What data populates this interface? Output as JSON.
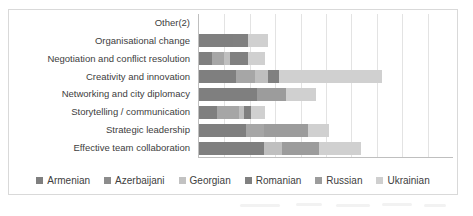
{
  "chart_data": {
    "type": "bar",
    "orientation": "horizontal",
    "stacked": true,
    "title": "",
    "xlabel": "",
    "ylabel": "",
    "grid": true,
    "legend_position": "bottom",
    "xlim": [
      0,
      18
    ],
    "xtick_labels_visible": false,
    "categories": [
      "Other(2)",
      "Organisational change",
      "Negotiation and conflict resolution",
      "Creativity and innovation",
      "Networking and city diplomacy",
      "Storytelling / communication",
      "Strategic leadership",
      "Effective team collaboration"
    ],
    "series": [
      {
        "name": "Armenian",
        "color": "#7f7f7f",
        "values": [
          0,
          2.4,
          0.9,
          2.6,
          4.1,
          1.3,
          3.3,
          4.6
        ]
      },
      {
        "name": "Azerbaijani",
        "color": "#a6a6a6",
        "values": [
          0,
          0,
          0.9,
          1.4,
          0,
          1.5,
          1.3,
          0
        ]
      },
      {
        "name": "Georgian",
        "color": "#bfbfbf",
        "values": [
          0,
          0,
          0.4,
          0.9,
          0,
          0.4,
          0,
          1.3
        ]
      },
      {
        "name": "Romanian",
        "color": "#808080",
        "values": [
          0,
          1.1,
          1.3,
          0.8,
          0,
          0.5,
          0,
          0
        ]
      },
      {
        "name": "Russian",
        "color": "#9c9c9c",
        "values": [
          0,
          0,
          0,
          0,
          2.1,
          0,
          3.1,
          2.6
        ]
      },
      {
        "name": "Ukrainian",
        "color": "#d0d0d0",
        "values": [
          0,
          1.4,
          1.2,
          7.3,
          2.1,
          1.0,
          1.5,
          3.0
        ]
      }
    ],
    "stack_totals": [
      0,
      4.9,
      4.7,
      13.0,
      8.3,
      4.7,
      9.2,
      11.5
    ]
  },
  "legend": {
    "items": [
      {
        "label": "Armenian",
        "color": "#7f7f7f"
      },
      {
        "label": "Azerbaijani",
        "color": "#8c8c8c"
      },
      {
        "label": "Georgian",
        "color": "#c2c2c2"
      },
      {
        "label": "Romanian",
        "color": "#808080"
      },
      {
        "label": "Russian",
        "color": "#9c9c9c"
      },
      {
        "label": "Ukrainian",
        "color": "#cfcfcf"
      }
    ]
  },
  "axis": {
    "gridline_count": 9
  },
  "style": {
    "frame_border": "#d9d9d9",
    "axis_line": "#bfbfbf",
    "gridline": "#e3e3e3",
    "label_color": "#404040",
    "background": "#ffffff"
  }
}
